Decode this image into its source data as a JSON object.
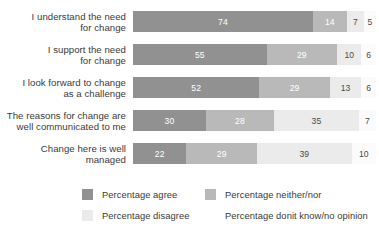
{
  "chart_data": {
    "type": "bar",
    "orientation": "horizontal",
    "stacked": true,
    "title": "",
    "subtitle": "",
    "xlabel": "",
    "ylabel": "",
    "xlim": [
      0,
      100
    ],
    "grid": false,
    "legend_position": "bottom",
    "categories": [
      "I understand the need\nfor change",
      "I support the need\nfor change",
      "I look forward to change\nas a challenge",
      "The reasons for change are\nwell communicated to me",
      "Change here is well\nmanaged"
    ],
    "series": [
      {
        "name": "Percentage agree",
        "color": "#919191",
        "values": [
          74,
          55,
          52,
          30,
          22
        ]
      },
      {
        "name": "Percentage neither/nor",
        "color": "#b9b9b9",
        "values": [
          14,
          29,
          29,
          28,
          29
        ]
      },
      {
        "name": "Percentage disagree",
        "color": "#ebebeb",
        "values": [
          7,
          10,
          13,
          35,
          39
        ]
      },
      {
        "name": "Percentage donit know/no opinion",
        "color": "#fbfbfb",
        "values": [
          5,
          6,
          6,
          7,
          10
        ]
      }
    ]
  },
  "rows": [
    {
      "label": "I understand the need\nfor change",
      "segments": [
        {
          "value": "74",
          "pct": 74
        },
        {
          "value": "14",
          "pct": 14
        },
        {
          "value": "7",
          "pct": 7
        },
        {
          "value": "5",
          "pct": 5
        }
      ]
    },
    {
      "label": "I support the need\nfor change",
      "segments": [
        {
          "value": "55",
          "pct": 55
        },
        {
          "value": "29",
          "pct": 29
        },
        {
          "value": "10",
          "pct": 10
        },
        {
          "value": "6",
          "pct": 6
        }
      ]
    },
    {
      "label": "I look forward to change\nas a challenge",
      "segments": [
        {
          "value": "52",
          "pct": 52
        },
        {
          "value": "29",
          "pct": 29
        },
        {
          "value": "13",
          "pct": 13
        },
        {
          "value": "6",
          "pct": 6
        }
      ]
    },
    {
      "label": "The reasons for change are\nwell communicated to me",
      "segments": [
        {
          "value": "30",
          "pct": 30
        },
        {
          "value": "28",
          "pct": 28
        },
        {
          "value": "35",
          "pct": 35
        },
        {
          "value": "7",
          "pct": 7
        }
      ]
    },
    {
      "label": "Change here is well\nmanaged",
      "segments": [
        {
          "value": "22",
          "pct": 22
        },
        {
          "value": "29",
          "pct": 29
        },
        {
          "value": "39",
          "pct": 39
        },
        {
          "value": "10",
          "pct": 10
        }
      ]
    }
  ],
  "legend": {
    "agree": {
      "label": "Percentage agree",
      "color": "#919191"
    },
    "neither": {
      "label": "Percentage neither/nor",
      "color": "#b9b9b9"
    },
    "disagree": {
      "label": "Percentage disagree",
      "color": "#ebebeb"
    },
    "dontknow": {
      "label": "Percentage donit know/no opinion",
      "color": "#fbfbfb"
    }
  }
}
